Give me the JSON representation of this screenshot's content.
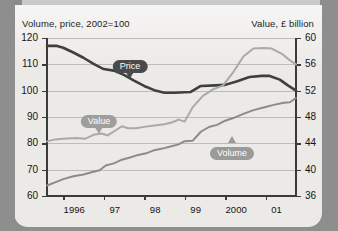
{
  "chart_data": {
    "type": "line",
    "title": "",
    "ylabel": "Volume, price, 2002=100",
    "ylabel_right": "Value, £ billion",
    "xlabel": "",
    "grid": true,
    "legend_position": "inline-callouts",
    "ylim": [
      60,
      120
    ],
    "yticks": [
      60,
      70,
      80,
      90,
      100,
      110,
      120
    ],
    "ylim_right": [
      36,
      60
    ],
    "yticks_right": [
      36,
      40,
      44,
      48,
      52,
      56,
      60
    ],
    "categories": [
      "1996",
      "97",
      "98",
      "99",
      "2000",
      "01"
    ],
    "xtick_labels": [
      "1996",
      "97",
      "98",
      "99",
      "2000",
      "01"
    ],
    "x_range": [
      1995.6,
      2001.75
    ],
    "series": [
      {
        "name": "Price",
        "axis": "left",
        "color": "#3f3f3f",
        "x": [
          1995.6,
          1995.85,
          1996.0,
          1996.25,
          1996.5,
          1996.75,
          1997.0,
          1997.25,
          1997.5,
          1997.75,
          1998.0,
          1998.25,
          1998.5,
          1998.75,
          1999.0,
          1999.15,
          1999.4,
          1999.75,
          2000.0,
          2000.3,
          2000.6,
          2000.9,
          2001.1,
          2001.35,
          2001.55,
          2001.75
        ],
        "values": [
          117.0,
          117.0,
          116.3,
          114.5,
          112.5,
          110.2,
          108.2,
          107.6,
          106.0,
          103.8,
          101.8,
          100.2,
          99.2,
          99.2,
          99.4,
          99.5,
          101.8,
          102.0,
          102.2,
          103.6,
          105.2,
          105.6,
          105.6,
          104.2,
          102.0,
          100.0
        ]
      },
      {
        "name": "Value",
        "axis": "right",
        "color": "#a9a9a7",
        "x": [
          1995.6,
          1995.8,
          1996.0,
          1996.3,
          1996.55,
          1996.75,
          1996.95,
          1997.1,
          1997.25,
          1997.45,
          1997.6,
          1997.8,
          1998.0,
          1998.25,
          1998.5,
          1998.7,
          1998.85,
          1999.0,
          1999.2,
          1999.45,
          1999.7,
          1999.95,
          2000.2,
          2000.45,
          2000.7,
          2000.95,
          2001.15,
          2001.4,
          2001.6,
          2001.75
        ],
        "values": [
          44.3,
          44.6,
          44.7,
          44.8,
          44.7,
          45.3,
          45.5,
          45.2,
          45.8,
          46.6,
          46.3,
          46.3,
          46.5,
          46.7,
          46.9,
          47.2,
          47.6,
          47.3,
          49.5,
          51.2,
          52.2,
          52.8,
          54.8,
          57.2,
          58.4,
          58.5,
          58.4,
          57.6,
          56.6,
          56.0
        ]
      },
      {
        "name": "Volume",
        "axis": "left",
        "color": "#8b8b89",
        "x": [
          1995.6,
          1995.8,
          1996.0,
          1996.25,
          1996.5,
          1996.7,
          1996.9,
          1997.05,
          1997.25,
          1997.45,
          1997.65,
          1997.85,
          1998.05,
          1998.25,
          1998.45,
          1998.65,
          1998.85,
          1999.0,
          1999.2,
          1999.4,
          1999.6,
          1999.8,
          2000.0,
          2000.2,
          2000.45,
          2000.7,
          2000.95,
          2001.2,
          2001.45,
          2001.6,
          2001.75
        ],
        "values": [
          64.0,
          65.2,
          66.4,
          67.5,
          68.2,
          69.0,
          69.8,
          71.6,
          72.4,
          73.8,
          74.6,
          75.6,
          76.2,
          77.4,
          78.0,
          78.8,
          79.6,
          80.8,
          81.0,
          84.4,
          86.2,
          87.0,
          88.6,
          89.6,
          91.2,
          92.6,
          93.6,
          94.6,
          95.4,
          95.6,
          97.2
        ]
      }
    ],
    "annotations": [
      {
        "label": "Price",
        "series": "Price",
        "color": "#4a4a4a",
        "x_px": 130,
        "y_px": 55,
        "direction": "down"
      },
      {
        "label": "Value",
        "series": "Value",
        "color": "#9e9e9c",
        "x_px": 99,
        "y_px": 110,
        "direction": "down"
      },
      {
        "label": "Volume",
        "series": "Volume",
        "color": "#9a9a98",
        "x_px": 232,
        "y_px": 142,
        "direction": "up"
      }
    ]
  },
  "colors": {
    "page_background": "#8e8e8e",
    "panel_background": "#eceae7",
    "grid": "#bdbcba",
    "axis": "#3a3a3a",
    "price": "#3f3f3f",
    "value": "#a9a9a7",
    "volume": "#8b8b89"
  }
}
